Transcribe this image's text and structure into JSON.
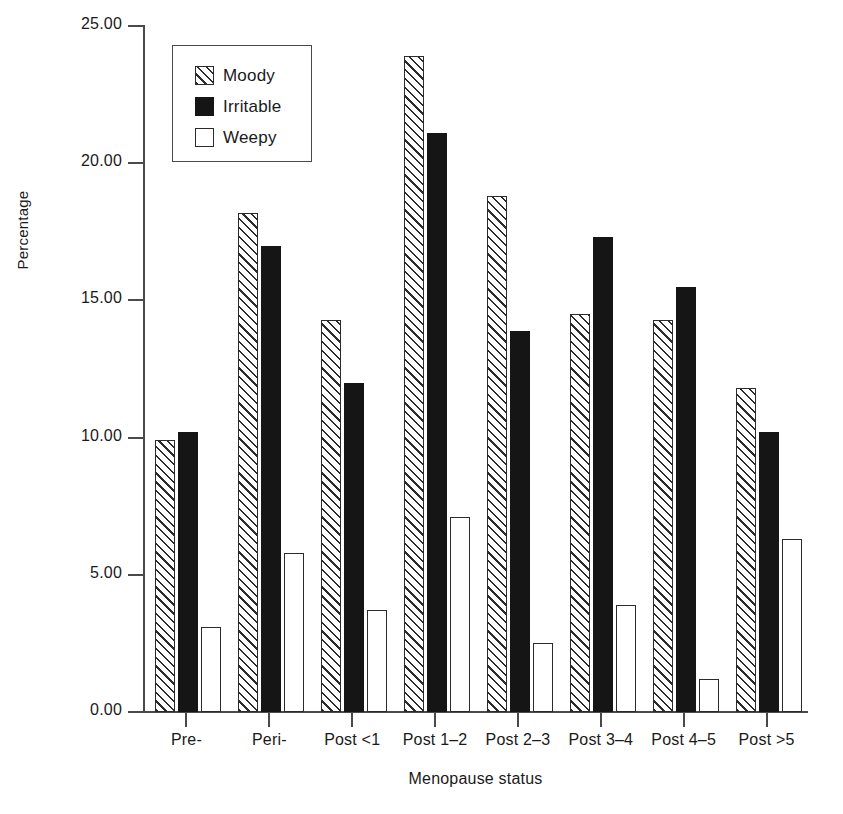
{
  "chart_data": {
    "type": "bar",
    "title": "",
    "xlabel": "Menopause status",
    "ylabel": "Percentage",
    "categories": [
      "Pre-",
      "Peri-",
      "Post <1",
      "Post 1–2",
      "Post 2–3",
      "Post 3–4",
      "Post 4–5",
      "Post >5"
    ],
    "series": [
      {
        "name": "Moody",
        "values": [
          9.9,
          18.2,
          14.3,
          23.9,
          18.8,
          14.5,
          14.3,
          11.8
        ]
      },
      {
        "name": "Irritable",
        "values": [
          10.2,
          17.0,
          12.0,
          21.1,
          13.9,
          17.3,
          15.5,
          10.2
        ]
      },
      {
        "name": "Weepy",
        "values": [
          3.1,
          5.8,
          3.7,
          7.1,
          2.5,
          3.9,
          1.2,
          6.3
        ]
      }
    ],
    "ylim": [
      0,
      25
    ],
    "yticks": [
      0,
      5,
      10,
      15,
      20,
      25
    ],
    "ytick_labels": [
      "0.00",
      "5.00",
      "10.00",
      "15.00",
      "20.00",
      "25.00"
    ],
    "grid": false,
    "legend_position": "top-left",
    "colors": {
      "Moody": "#ffffff",
      "Irritable": "#151515",
      "Weepy": "#ffffff",
      "outline": "#2b2b2b",
      "axis": "#4a4a4a"
    },
    "fill_patterns": {
      "Moody": "diagonal-hatch",
      "Irritable": "solid-black",
      "Weepy": "empty-white"
    }
  },
  "legend": {
    "items": [
      {
        "label": "Moody",
        "pattern": "diagonal-hatch"
      },
      {
        "label": "Irritable",
        "pattern": "solid-black"
      },
      {
        "label": "Weepy",
        "pattern": "empty-white"
      }
    ]
  }
}
